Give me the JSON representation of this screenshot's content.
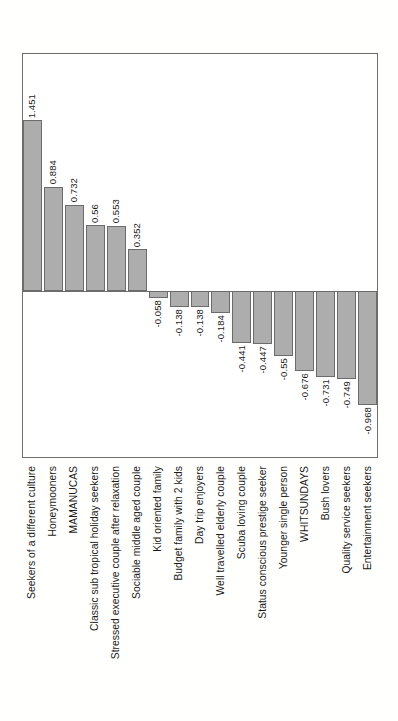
{
  "chart_data": {
    "type": "bar",
    "title": "",
    "subtitle": "",
    "xlabel": "",
    "ylabel": "",
    "orientation": "vertical",
    "grid": false,
    "legend": null,
    "ylim": [
      -1.1,
      1.6
    ],
    "zero_line": 0,
    "categories": [
      "Seekers of a different culture",
      "Honeymooners",
      "MAMANUCAS",
      "Classic sub tropical holiday seekers",
      "Stressed executive couple after relaxation",
      "Sociable middle aged couple",
      "Kid oriented family",
      "Budget family with 2 kids",
      "Day trip enjoyers",
      "Well travelled elderly couple",
      "Scuba loving couple",
      "Status conscious prestige seeker",
      "Younger single person",
      "WHITSUNDAYS",
      "Bush lovers",
      "Quality service seekers",
      "Entertainment seekers"
    ],
    "values": [
      1.451,
      0.884,
      0.732,
      0.56,
      0.553,
      0.352,
      -0.058,
      -0.138,
      -0.138,
      -0.184,
      -0.441,
      -0.447,
      -0.55,
      -0.676,
      -0.731,
      -0.749,
      -0.968
    ],
    "value_labels": [
      "1.451",
      "0.884",
      "0.732",
      "0.56",
      "0.553",
      "0.352",
      "-0.058",
      "-0.138",
      "-0.138",
      "-0.184",
      "-0.441",
      "-0.447",
      "-0.55",
      "-0.676",
      "-0.731",
      "-0.749",
      "-0.968"
    ],
    "colors": {
      "bar_fill": "#adadad",
      "bar_stroke": "#6b6b6b",
      "axis": "#6e6e6e",
      "text": "#1a1a1a",
      "background": "#fffffd",
      "plot_background": "#ffffff"
    }
  }
}
